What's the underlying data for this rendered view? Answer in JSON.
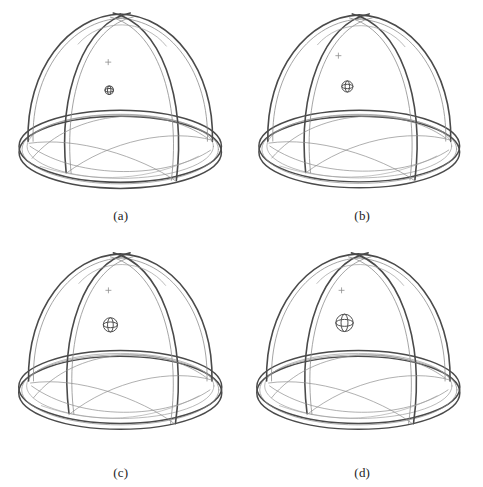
{
  "figure": {
    "background_color": "#ffffff",
    "line_color": "#3a3a3a",
    "line_color_light": "#8a8a8a",
    "caption_color": "#1d1d1d",
    "panel_count": 4,
    "layout": "2x2 grid"
  },
  "panels": [
    {
      "id": "a",
      "caption": "(a)",
      "marker_name": "wireframe-sphere-marker",
      "marker_radius_px": 4.2,
      "marker_center_x": 109,
      "marker_center_y": 90,
      "dot_marker_x": 108,
      "dot_marker_y": 62,
      "dome_center_x": 120,
      "dome_center_y": 148,
      "dome_rx": 101,
      "dome_ry": 36,
      "dome_height": 136,
      "rim_offset": 6
    },
    {
      "id": "b",
      "caption": "(b)",
      "marker_name": "wireframe-sphere-marker",
      "marker_radius_px": 5.6,
      "marker_center_x": 106,
      "marker_center_y": 86,
      "dot_marker_x": 97,
      "dot_marker_y": 55,
      "dome_center_x": 118,
      "dome_center_y": 148,
      "dome_rx": 101,
      "dome_ry": 36,
      "dome_height": 136,
      "rim_offset": 6
    },
    {
      "id": "c",
      "caption": "(c)",
      "marker_name": "wireframe-sphere-marker",
      "marker_radius_px": 7.2,
      "marker_center_x": 110,
      "marker_center_y": 82,
      "dot_marker_x": 108,
      "dot_marker_y": 47,
      "dome_center_x": 120,
      "dome_center_y": 145,
      "dome_rx": 103,
      "dome_ry": 37,
      "dome_height": 140,
      "rim_offset": 6
    },
    {
      "id": "d",
      "caption": "(d)",
      "marker_name": "wireframe-sphere-marker",
      "marker_radius_px": 8.8,
      "marker_center_x": 103,
      "marker_center_y": 80,
      "dot_marker_x": 100,
      "dot_marker_y": 47,
      "dome_center_x": 117,
      "dome_center_y": 145,
      "dome_rx": 103,
      "dome_ry": 37,
      "dome_height": 140,
      "rim_offset": 6
    }
  ]
}
